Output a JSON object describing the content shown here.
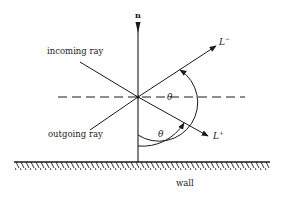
{
  "diagram": {
    "normal_label": "n",
    "incoming_label": "incoming ray",
    "outgoing_label": "outgoing ray",
    "l_minus": {
      "base": "L",
      "sup": "−"
    },
    "l_plus": {
      "base": "L",
      "sup": "+"
    },
    "theta_upper": "θ",
    "theta_lower": "θ",
    "wall_label": "wall",
    "colors": {
      "ink": "#1a1a1a",
      "background": "#ffffff"
    }
  }
}
